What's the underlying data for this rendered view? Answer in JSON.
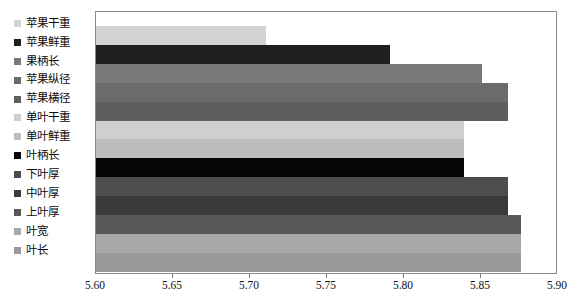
{
  "chart_data": {
    "type": "bar",
    "orientation": "horizontal",
    "title": "",
    "subtitle": "",
    "xlabel": "",
    "ylabel": "",
    "xlim": [
      5.6,
      5.9
    ],
    "xticks": [
      "5.60",
      "5.65",
      "5.70",
      "5.75",
      "5.80",
      "5.85",
      "5.90"
    ],
    "xtick_values": [
      5.6,
      5.65,
      5.7,
      5.75,
      5.8,
      5.85,
      5.9
    ],
    "grid": false,
    "legend_position": "left",
    "categories": [
      "苹果干重",
      "苹果鲜重",
      "果柄长",
      "苹果纵径",
      "苹果横径",
      "单叶干重",
      "单叶鲜重",
      "叶柄长",
      "下叶厚",
      "中叶厚",
      "上叶厚",
      "叶宽",
      "叶长"
    ],
    "values": [
      5.711,
      5.792,
      5.852,
      5.869,
      5.869,
      5.84,
      5.84,
      5.84,
      5.869,
      5.869,
      5.877,
      5.877,
      5.877
    ],
    "colors": [
      "#d3d3d3",
      "#1f1f1f",
      "#787878",
      "#6b6b6b",
      "#5e5e5e",
      "#cfcfcf",
      "#bdbdbd",
      "#050505",
      "#4d4d4d",
      "#3a3a3a",
      "#595959",
      "#a8a8a8",
      "#9a9a9a"
    ]
  },
  "legend": {
    "items": [
      {
        "label": "苹果干重",
        "color": "#d3d3d3"
      },
      {
        "label": "苹果鲜重",
        "color": "#1f1f1f"
      },
      {
        "label": "果柄长",
        "color": "#787878"
      },
      {
        "label": "苹果纵径",
        "color": "#6b6b6b"
      },
      {
        "label": "苹果横径",
        "color": "#5e5e5e"
      },
      {
        "label": "单叶干重",
        "color": "#cfcfcf"
      },
      {
        "label": "单叶鲜重",
        "color": "#bdbdbd"
      },
      {
        "label": "叶柄长",
        "color": "#050505"
      },
      {
        "label": "下叶厚",
        "color": "#4d4d4d"
      },
      {
        "label": "中叶厚",
        "color": "#3a3a3a"
      },
      {
        "label": "上叶厚",
        "color": "#595959"
      },
      {
        "label": "叶宽",
        "color": "#a8a8a8"
      },
      {
        "label": "叶长",
        "color": "#9a9a9a"
      }
    ]
  }
}
